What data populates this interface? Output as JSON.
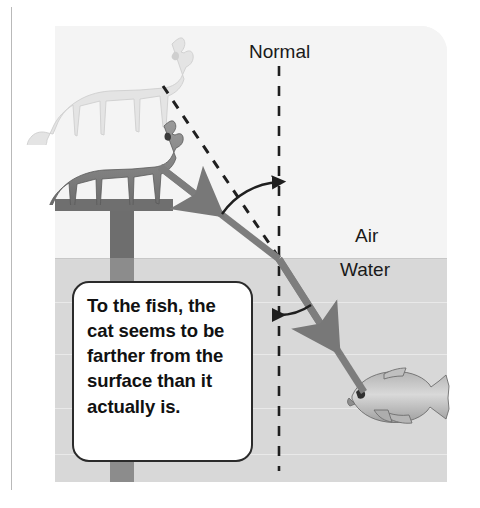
{
  "figure": {
    "domain_label": "refraction-diagram",
    "panel": {
      "air_label": "Air",
      "water_label": "Water",
      "normal_label": "Normal"
    },
    "callout": {
      "text": "To the fish, the cat seems to be farther from the surface than it actually is."
    },
    "objects": {
      "apparent_cat_name": "apparent-cat-image",
      "real_cat_name": "real-cat",
      "fish_name": "fish",
      "post_name": "post",
      "crossbar_name": "post-crossbar"
    },
    "rays": {
      "incident_ray_name": "incident-light-ray",
      "refracted_ray_name": "refracted-light-ray",
      "apparent_ray_name": "apparent-position-dashed-ray",
      "normal_line_name": "normal-dashed-line",
      "incidence_arc_name": "angle-of-incidence-arc",
      "refraction_arc_name": "angle-of-refraction-arc"
    },
    "colors": {
      "ray": "#7d7d7d",
      "air": "#f4f4f4",
      "water": "#d8d8d8",
      "outline": "#2b2b2b",
      "text": "#111111",
      "post": "#6f6f6f"
    }
  }
}
